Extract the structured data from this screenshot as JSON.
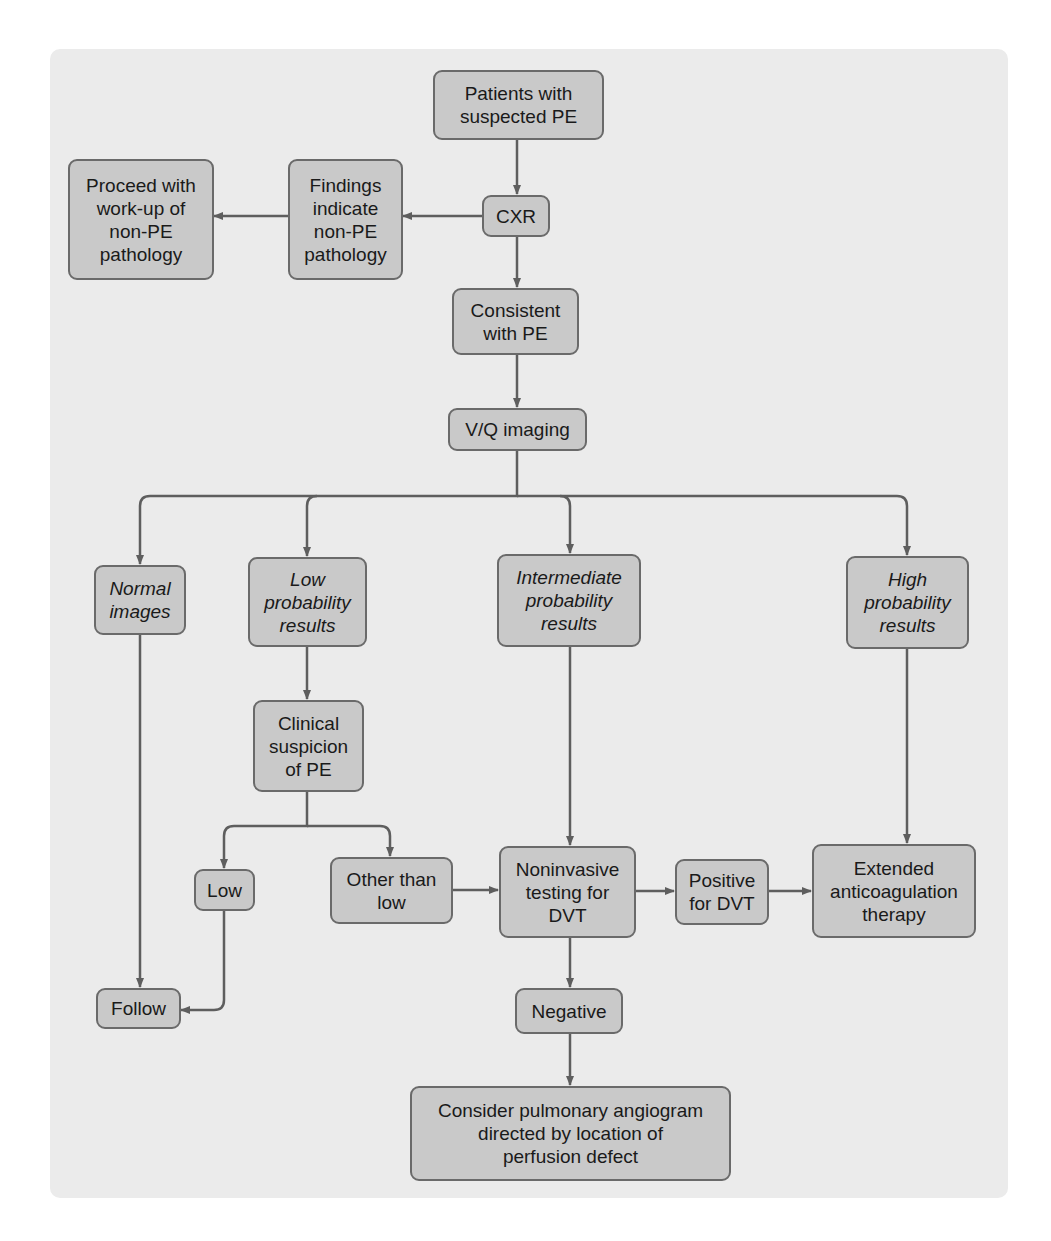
{
  "diagram": {
    "colors": {
      "panel": "#ebebeb",
      "box_fill": "#c9c9c9",
      "box_border": "#6a6a6a",
      "connector": "#5e5e5e"
    },
    "nodes": {
      "patients": "Patients with\nsuspected PE",
      "cxr": "CXR",
      "findings": "Findings\nindicate\nnon-PE\npathology",
      "proceed": "Proceed with\nwork-up of\nnon-PE\npathology",
      "consistent": "Consistent\nwith PE",
      "vq": "V/Q imaging",
      "normal": "Normal\nimages",
      "low_prob": "Low\nprobability\nresults",
      "intermediate": "Intermediate\nprobability\nresults",
      "high": "High\nprobability\nresults",
      "clinical": "Clinical\nsuspicion\nof PE",
      "low": "Low",
      "other": "Other than\nlow",
      "noninvasive": "Noninvasive\ntesting for\nDVT",
      "positive": "Positive\nfor DVT",
      "extended": "Extended\nanticoagulation\ntherapy",
      "follow": "Follow",
      "negative": "Negative",
      "angiogram": "Consider pulmonary angiogram\ndirected by location of\nperfusion defect"
    },
    "edges": [
      [
        "patients",
        "cxr"
      ],
      [
        "cxr",
        "findings"
      ],
      [
        "findings",
        "proceed"
      ],
      [
        "cxr",
        "consistent"
      ],
      [
        "consistent",
        "vq"
      ],
      [
        "vq",
        "normal"
      ],
      [
        "vq",
        "low_prob"
      ],
      [
        "vq",
        "intermediate"
      ],
      [
        "vq",
        "high"
      ],
      [
        "low_prob",
        "clinical"
      ],
      [
        "clinical",
        "low"
      ],
      [
        "clinical",
        "other"
      ],
      [
        "other",
        "noninvasive"
      ],
      [
        "intermediate",
        "noninvasive"
      ],
      [
        "noninvasive",
        "positive"
      ],
      [
        "positive",
        "extended"
      ],
      [
        "high",
        "extended"
      ],
      [
        "normal",
        "follow"
      ],
      [
        "low",
        "follow"
      ],
      [
        "noninvasive",
        "negative"
      ],
      [
        "negative",
        "angiogram"
      ]
    ]
  }
}
